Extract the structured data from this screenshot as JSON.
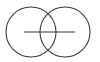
{
  "diagram": {
    "type": "venn-like-symbol",
    "stroke_color": "#3a3a3a",
    "background": "#ffffff",
    "shapes": [
      {
        "kind": "circle",
        "name": "left-circle",
        "cx": 31,
        "cy": 32,
        "r": 25
      },
      {
        "kind": "circle",
        "name": "right-circle",
        "cx": 65,
        "cy": 32,
        "r": 25
      },
      {
        "kind": "line",
        "name": "horizontal-line",
        "x1": 24,
        "y1": 32,
        "x2": 75,
        "y2": 32
      }
    ]
  }
}
